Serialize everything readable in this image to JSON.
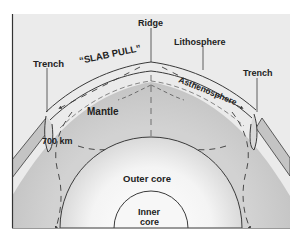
{
  "diagram": {
    "labels": {
      "trench_left": "Trench",
      "slab_pull": "“SLAB PULL”",
      "ridge": "Ridge",
      "lithosphere": "Lithosphere",
      "trench_right": "Trench",
      "asthenosphere": "Asthenosphere",
      "mantle": "Mantle",
      "depth_700": "700 km",
      "outer_core": "Outer core",
      "inner_core_line1": "Inner",
      "inner_core_line2": "core"
    },
    "colors": {
      "background": "#ebebeb",
      "mantle": "#bdbdbd",
      "outer_core_center": "#ffffff",
      "outer_core_edge": "#c8c8c8",
      "inner_core": "#f7f7f7",
      "line": "#3a3a3a",
      "text": "#222222"
    }
  }
}
